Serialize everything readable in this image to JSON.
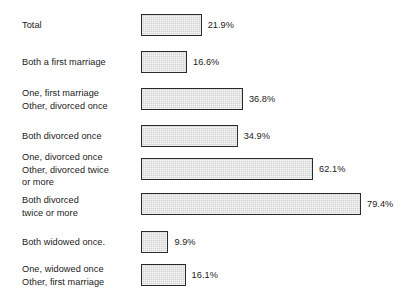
{
  "chart_data": {
    "type": "bar",
    "orientation": "horizontal",
    "title": "",
    "subtitle": "",
    "xlabel": "",
    "ylabel": "",
    "grid": false,
    "legend": null,
    "value_suffix": "%",
    "xlim": [
      0,
      79.4
    ],
    "categories": [
      "Total",
      "Both a first marriage",
      "One, first marriage\nOther, divorced once",
      "Both divorced once",
      "One, divorced once\nOther, divorced twice\nor more",
      "Both divorced\ntwice or more",
      "Both widowed once",
      "One, widowed once\nOther, first marriage"
    ],
    "values": [
      21.9,
      16.6,
      36.8,
      34.9,
      62.1,
      79.4,
      9.9,
      16.1
    ],
    "value_labels": [
      "21.9%",
      "16.6%",
      "36.8%",
      "34.9%",
      "62.1%",
      "79.4%",
      "9.9%",
      "16.1%"
    ],
    "colors": {
      "bar_fill": "#d2d2d2",
      "bar_border": "#2b2b2b",
      "text": "#1a1a1a",
      "background": "#ffffff"
    }
  },
  "rows": [
    {
      "label": "Total",
      "value": 21.9,
      "value_label": "21.9%",
      "label_top": 19,
      "bar_top": 14
    },
    {
      "label": "Both a first marriage",
      "value": 16.6,
      "value_label": "16.6%",
      "label_top": 56,
      "bar_top": 51
    },
    {
      "label": "One, first marriage\nOther, divorced once",
      "value": 36.8,
      "value_label": "36.8%",
      "label_top": 87,
      "bar_top": 88
    },
    {
      "label": "Both divorced once",
      "value": 34.9,
      "value_label": "34.9%",
      "label_top": 130,
      "bar_top": 125
    },
    {
      "label": "One, divorced once\nOther, divorced twice\nor more",
      "value": 62.1,
      "value_label": "62.1%",
      "label_top": 151,
      "bar_top": 158
    },
    {
      "label": "Both divorced\ntwice or more",
      "value": 79.4,
      "value_label": "79.4%",
      "label_top": 194,
      "bar_top": 193
    },
    {
      "label": "Both widowed once.",
      "value": 9.9,
      "value_label": "9.9%",
      "label_top": 236,
      "bar_top": 231
    },
    {
      "label": "One, widowed once\nOther, first marriage",
      "value": 16.1,
      "value_label": "16.1%",
      "label_top": 263,
      "bar_top": 264
    }
  ]
}
